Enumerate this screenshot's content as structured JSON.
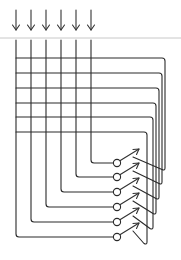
{
  "diagram": {
    "type": "crossbar-switch-matrix",
    "colors": {
      "line": "#2a2a2a",
      "divider": "#c8c8c8",
      "background": "#ffffff"
    },
    "inputs": {
      "count": 6,
      "x": [
        16,
        31,
        46,
        61,
        76,
        91
      ],
      "arrow_top": 10,
      "arrow_bottom": 30,
      "icon": "down-arrow-icon"
    },
    "divider_y": 38,
    "grid": {
      "top": 40,
      "left": 16,
      "rows_y": [
        58,
        73,
        88,
        103,
        117,
        132
      ],
      "return_x": [
        165,
        162,
        159,
        156,
        153,
        147
      ]
    },
    "switches": {
      "count": 6,
      "circle_x": 117,
      "circle_y": [
        163,
        177,
        192,
        207,
        222,
        237
      ],
      "radius": 3.6,
      "icon": "switch-arrow-icon"
    }
  }
}
